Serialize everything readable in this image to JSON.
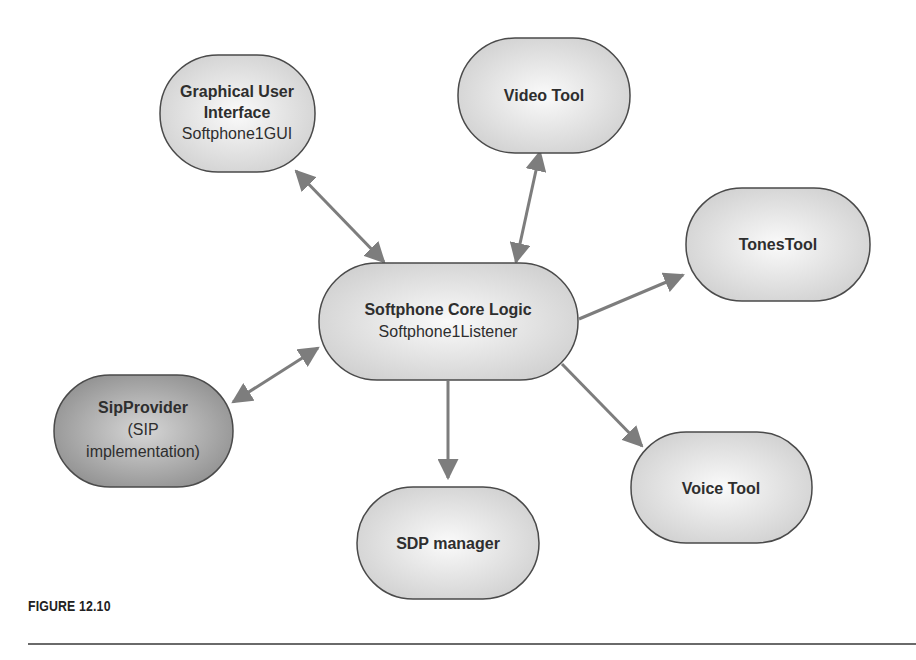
{
  "diagram": {
    "nodes": {
      "gui": {
        "line1": "Graphical User",
        "line2": "Interface",
        "line3": "Softphone1GUI"
      },
      "video": {
        "line1": "Video Tool"
      },
      "tones": {
        "line1": "TonesTool"
      },
      "core": {
        "line1": "Softphone Core Logic",
        "line2": "Softphone1Listener"
      },
      "sip": {
        "line1": "SipProvider",
        "line2": "(SIP",
        "line3": "implementation)"
      },
      "voice": {
        "line1": "Voice Tool"
      },
      "sdp": {
        "line1": "SDP manager"
      }
    },
    "edges": [
      {
        "from": "gui",
        "to": "core",
        "direction": "bidirectional"
      },
      {
        "from": "video",
        "to": "core",
        "direction": "bidirectional"
      },
      {
        "from": "core",
        "to": "tones",
        "direction": "forward"
      },
      {
        "from": "sip",
        "to": "core",
        "direction": "bidirectional"
      },
      {
        "from": "core",
        "to": "sdp",
        "direction": "forward"
      },
      {
        "from": "core",
        "to": "voice",
        "direction": "forward"
      }
    ],
    "colors": {
      "node_fill": "#e4e4e4",
      "node_fill_dark": "#a8a8a8",
      "stroke": "#4a4a4a",
      "arrow": "#808080"
    }
  },
  "caption": {
    "label": "FIGURE 12.10"
  }
}
